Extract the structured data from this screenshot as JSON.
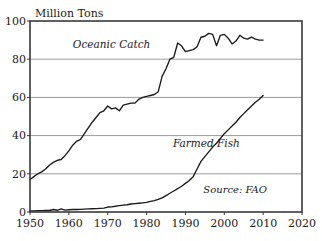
{
  "chart_data": {
    "type": "line",
    "title": "",
    "ylabel": "Million Tons",
    "xlabel": "",
    "xlim": [
      1950,
      2020
    ],
    "ylim": [
      0,
      100
    ],
    "grid": true,
    "legend_position": "inline-annotations",
    "y_ticks": [
      "0",
      "20",
      "40",
      "60",
      "80",
      "100"
    ],
    "y_tick_values": [
      0,
      20,
      40,
      60,
      80,
      100
    ],
    "x_ticks": [
      "1950",
      "1960",
      "1970",
      "1980",
      "1990",
      "2000",
      "2010",
      "2020"
    ],
    "x_tick_values": [
      1950,
      1960,
      1970,
      1980,
      1990,
      2000,
      2010,
      2020
    ],
    "annotations": [
      {
        "name": "oceanic-catch-label",
        "text": "Oceanic Catch",
        "x": 1971,
        "y": 86
      },
      {
        "name": "farmed-fish-label",
        "text": "Farmed Fish",
        "x": 2004,
        "y": 34
      },
      {
        "name": "source-label",
        "text": "Source: FAO",
        "x": 2011,
        "y": 10
      }
    ],
    "series": [
      {
        "name": "Oceanic Catch",
        "color": "#1a1a1a",
        "x": [
          1950,
          1951,
          1952,
          1953,
          1954,
          1955,
          1956,
          1957,
          1958,
          1959,
          1960,
          1961,
          1962,
          1963,
          1964,
          1965,
          1966,
          1967,
          1968,
          1969,
          1970,
          1971,
          1972,
          1973,
          1974,
          1975,
          1976,
          1977,
          1978,
          1979,
          1980,
          1981,
          1982,
          1983,
          1984,
          1985,
          1986,
          1987,
          1988,
          1989,
          1990,
          1991,
          1992,
          1993,
          1994,
          1995,
          1996,
          1997,
          1998,
          1999,
          2000,
          2001,
          2002,
          2003,
          2004,
          2005,
          2006,
          2007,
          2008,
          2009,
          2010
        ],
        "values": [
          17,
          18.5,
          20,
          21,
          22.5,
          24.5,
          26,
          27,
          27.5,
          29.5,
          32,
          35,
          37,
          38,
          41,
          44,
          47,
          49.5,
          52,
          53,
          55.5,
          54,
          54.5,
          53,
          56,
          56.5,
          57,
          57,
          59,
          60,
          60.5,
          61,
          61.5,
          63,
          71,
          75,
          80,
          81,
          88.5,
          87,
          84,
          84.5,
          85,
          86.5,
          91.5,
          92,
          93.5,
          93,
          87,
          92.5,
          93,
          91,
          88,
          89.5,
          92.5,
          91,
          90.5,
          91.5,
          90.5,
          90,
          90
        ]
      },
      {
        "name": "Farmed Fish",
        "color": "#1a1a1a",
        "x": [
          1950,
          1951,
          1952,
          1953,
          1954,
          1955,
          1956,
          1957,
          1958,
          1959,
          1960,
          1961,
          1962,
          1963,
          1964,
          1965,
          1966,
          1967,
          1968,
          1969,
          1970,
          1971,
          1972,
          1973,
          1974,
          1975,
          1976,
          1977,
          1978,
          1979,
          1980,
          1981,
          1982,
          1983,
          1984,
          1985,
          1986,
          1987,
          1988,
          1989,
          1990,
          1991,
          1992,
          1993,
          1994,
          1995,
          1996,
          1997,
          1998,
          1999,
          2000,
          2001,
          2002,
          2003,
          2004,
          2005,
          2006,
          2007,
          2008,
          2009,
          2010
        ],
        "values": [
          0.6,
          0.6,
          0.7,
          0.7,
          0.8,
          0.8,
          1.3,
          0.9,
          1.6,
          1.0,
          1.2,
          1.3,
          1.3,
          1.4,
          1.5,
          1.6,
          1.7,
          1.8,
          1.9,
          2.0,
          2.6,
          2.7,
          3.0,
          3.3,
          3.6,
          3.8,
          4.2,
          4.4,
          4.6,
          4.8,
          5.0,
          5.6,
          6.0,
          6.6,
          7.4,
          8.6,
          9.8,
          11.0,
          12.2,
          13.5,
          15.0,
          16.5,
          18.5,
          22.5,
          26.5,
          29.0,
          31.5,
          34.0,
          36.0,
          38.5,
          41.0,
          43.0,
          45.0,
          47.0,
          49.5,
          51.5,
          53.5,
          55.5,
          57.5,
          59.0,
          61.0
        ]
      }
    ]
  },
  "plot": {
    "left": 30,
    "top": 21,
    "right": 302,
    "bottom": 212
  }
}
